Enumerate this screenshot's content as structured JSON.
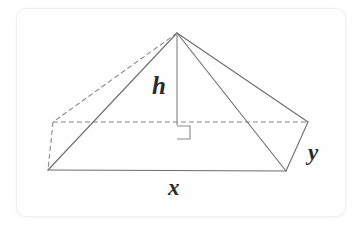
{
  "figure": {
    "kind": "rectangular-pyramid-diagram",
    "card": {
      "background_color": "#fefefe",
      "border_color": "#f1f1f1",
      "page_background": "#ffffff"
    },
    "stroke": {
      "solid_color": "#6e6e6e",
      "dashed_color": "#8a8a8a",
      "height_line_color": "#8a8a8a",
      "right_angle_color": "#8a8a8a",
      "solid_width": 1.1,
      "dashed_width": 1.1,
      "dash_pattern": "5,3"
    },
    "vertices": {
      "apex": {
        "name": "apex",
        "x": 177,
        "y": 33
      },
      "front_left": {
        "name": "front-left-base-corner",
        "x": 48,
        "y": 170
      },
      "front_right": {
        "name": "front-right-base-corner",
        "x": 286,
        "y": 171
      },
      "back_right": {
        "name": "back-right-base-corner",
        "x": 308,
        "y": 122
      },
      "back_left": {
        "name": "back-left-base-corner",
        "x": 53,
        "y": 122
      },
      "base_center": {
        "name": "base-center-foot-of-height",
        "x": 177,
        "y": 125
      }
    },
    "edges": [
      {
        "name": "apex-to-front-left",
        "style": "solid",
        "from": "apex",
        "to": "front_left"
      },
      {
        "name": "apex-to-front-right",
        "style": "solid",
        "from": "apex",
        "to": "front_right"
      },
      {
        "name": "apex-to-back-right",
        "style": "solid",
        "from": "apex",
        "to": "back_right"
      },
      {
        "name": "front-left-to-front-right",
        "style": "solid",
        "from": "front_left",
        "to": "front_right"
      },
      {
        "name": "front-right-to-back-right",
        "style": "solid",
        "from": "front_right",
        "to": "back_right"
      },
      {
        "name": "apex-to-back-left",
        "style": "dashed",
        "from": "apex",
        "to": "back_left"
      },
      {
        "name": "back-left-to-front-left",
        "style": "dashed",
        "from": "back_left",
        "to": "front_left"
      },
      {
        "name": "back-left-to-back-right",
        "style": "dashed",
        "from": "back_left",
        "to": "back_right"
      }
    ],
    "height_line": {
      "name": "height-segment",
      "from": "apex",
      "to": "base_center",
      "style": "solid"
    },
    "right_angle_marker": {
      "name": "right-angle-square",
      "x": 177,
      "y": 126,
      "size": 13
    },
    "labels": {
      "height": "h",
      "base_length": "x",
      "base_width": "y"
    }
  }
}
